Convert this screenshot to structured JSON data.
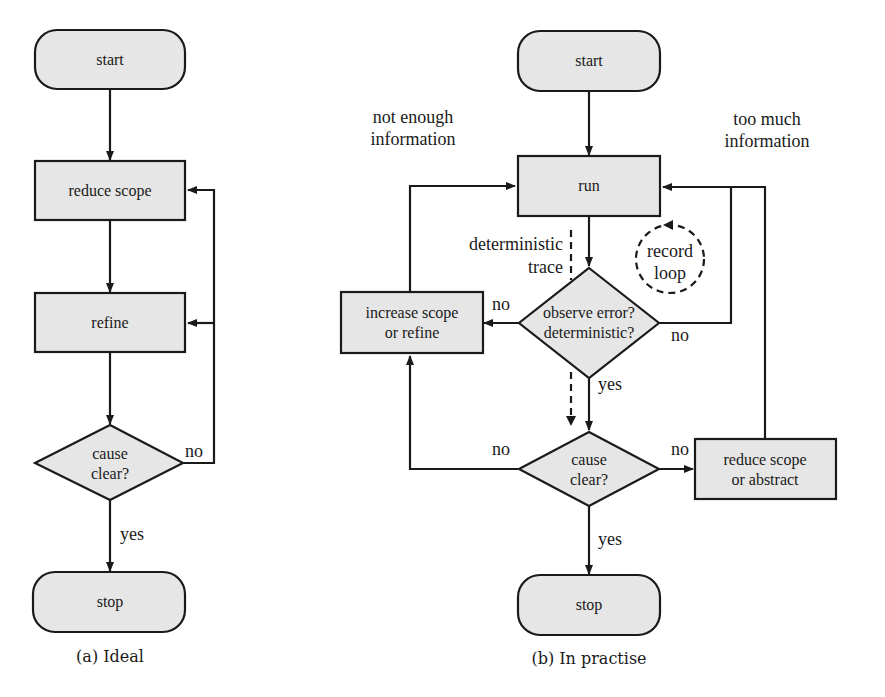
{
  "diagram_a": {
    "caption": "(a) Ideal",
    "nodes": {
      "start": "start",
      "reduce_scope": "reduce scope",
      "refine": "refine",
      "cause_clear_line1": "cause",
      "cause_clear_line2": "clear?",
      "stop": "stop"
    },
    "edge_labels": {
      "no": "no",
      "yes": "yes"
    }
  },
  "diagram_b": {
    "caption": "(b) In practise",
    "nodes": {
      "start": "start",
      "run": "run",
      "observe_line1": "observe error?",
      "observe_line2": "deterministic?",
      "increase_line1": "increase scope",
      "increase_line2": "or refine",
      "cause_clear_line1": "cause",
      "cause_clear_line2": "clear?",
      "reduce_line1": "reduce scope",
      "reduce_line2": "or abstract",
      "stop": "stop"
    },
    "annotations": {
      "not_enough_line1": "not enough",
      "not_enough_line2": "information",
      "too_much_line1": "too much",
      "too_much_line2": "information",
      "det_trace_line1": "deterministic",
      "det_trace_line2": "trace",
      "record_loop_line1": "record",
      "record_loop_line2": "loop"
    },
    "edge_labels": {
      "observe_no_left": "no",
      "observe_no_right": "no",
      "observe_yes": "yes",
      "cause_no_left": "no",
      "cause_no_right": "no",
      "cause_yes": "yes"
    }
  },
  "colors": {
    "node_fill": "#e6e6e6",
    "stroke": "#1a1a1a",
    "background": "#ffffff"
  }
}
